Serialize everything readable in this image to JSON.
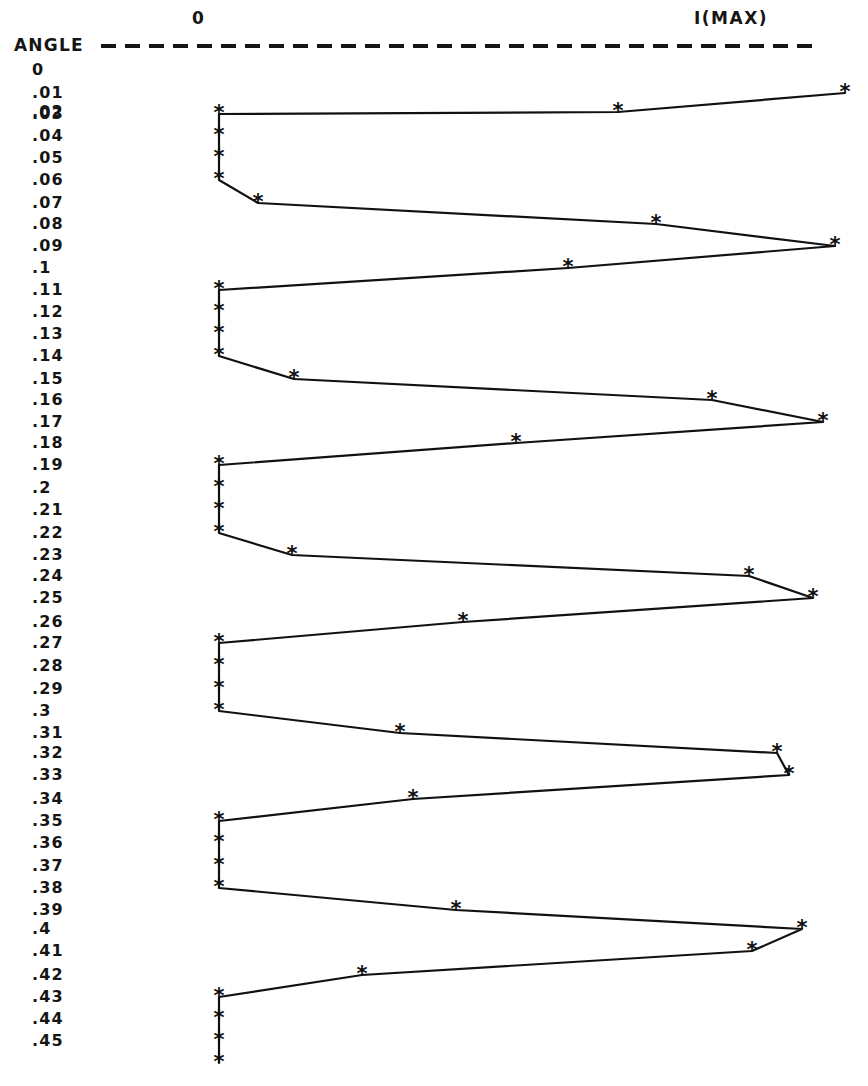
{
  "header": {
    "left_column_label": "0",
    "right_column_label": "I(MAX)",
    "axis_caption": "ANGLE"
  },
  "chart_data": {
    "type": "line",
    "title": "",
    "subtitle": "",
    "xlabel": "I(MAX)",
    "ylabel": "ANGLE",
    "orientation": "horizontal-value-vertical-category",
    "grid": false,
    "legend": false,
    "axis_origin_label": "0",
    "axis_max_label": "I(MAX)",
    "x_axis_pixel_origin": 219,
    "x_axis_pixel_max": 850,
    "marker_glyph": "*",
    "line_color": "#111111",
    "marker_color": "#111111",
    "categories": [
      "0",
      ".01",
      ".02",
      ".03",
      ".04",
      ".05",
      ".06",
      ".07",
      ".08",
      ".09",
      ".1",
      ".11",
      ".12",
      ".13",
      ".14",
      ".15",
      ".16",
      ".17",
      ".18",
      ".19",
      ".2",
      ".21",
      ".22",
      ".23",
      ".24",
      ".25",
      ".26",
      ".27",
      ".28",
      ".29",
      ".3",
      ".31",
      ".32",
      ".33",
      ".34",
      ".35",
      ".36",
      ".37",
      ".38",
      ".39",
      ".4",
      ".41",
      ".42",
      ".43",
      ".44",
      ".45"
    ],
    "values": [
      null,
      0.992,
      0.633,
      0.0,
      0.0,
      0.0,
      0.062,
      0.694,
      0.975,
      0.553,
      0.0,
      0.0,
      0.0,
      0.0,
      0.118,
      0.781,
      0.957,
      0.469,
      0.0,
      0.0,
      0.0,
      0.0,
      0.117,
      0.84,
      0.941,
      0.387,
      0.0,
      0.0,
      0.0,
      0.0,
      0.179,
      0.884,
      0.903,
      0.307,
      0.0,
      0.0,
      0.0,
      0.0,
      0.239,
      0.924,
      0.845,
      0.227,
      0.0,
      0.0,
      0.0,
      0.0
    ],
    "points_pixels": [
      {
        "category": "0",
        "x": null,
        "y": 70
      },
      {
        "category": ".01",
        "x": 845,
        "y": 93
      },
      {
        "category": ".02",
        "x": 618,
        "y": 112
      },
      {
        "category": ".03",
        "x": 219,
        "y": 114
      },
      {
        "category": ".04",
        "x": 219,
        "y": 136
      },
      {
        "category": ".05",
        "x": 219,
        "y": 158
      },
      {
        "category": ".06",
        "x": 219,
        "y": 180
      },
      {
        "category": ".07",
        "x": 258,
        "y": 203
      },
      {
        "category": ".08",
        "x": 656,
        "y": 224
      },
      {
        "category": ".09",
        "x": 835,
        "y": 246
      },
      {
        "category": ".1",
        "x": 568,
        "y": 268
      },
      {
        "category": ".11",
        "x": 219,
        "y": 290
      },
      {
        "category": ".12",
        "x": 219,
        "y": 312
      },
      {
        "category": ".13",
        "x": 219,
        "y": 334
      },
      {
        "category": ".14",
        "x": 219,
        "y": 356
      },
      {
        "category": ".15",
        "x": 294,
        "y": 379
      },
      {
        "category": ".16",
        "x": 712,
        "y": 400
      },
      {
        "category": ".17",
        "x": 823,
        "y": 422
      },
      {
        "category": ".18",
        "x": 516,
        "y": 443
      },
      {
        "category": ".19",
        "x": 219,
        "y": 465
      },
      {
        "category": ".2",
        "x": 219,
        "y": 488
      },
      {
        "category": ".21",
        "x": 219,
        "y": 510
      },
      {
        "category": ".22",
        "x": 219,
        "y": 533
      },
      {
        "category": ".23",
        "x": 292,
        "y": 555
      },
      {
        "category": ".24",
        "x": 749,
        "y": 576
      },
      {
        "category": ".25",
        "x": 813,
        "y": 598
      },
      {
        "category": ".26",
        "x": 463,
        "y": 622
      },
      {
        "category": ".27",
        "x": 219,
        "y": 643
      },
      {
        "category": ".28",
        "x": 219,
        "y": 666
      },
      {
        "category": ".29",
        "x": 219,
        "y": 689
      },
      {
        "category": ".3",
        "x": 219,
        "y": 711
      },
      {
        "category": ".31",
        "x": 400,
        "y": 733
      },
      {
        "category": ".32",
        "x": 777,
        "y": 753
      },
      {
        "category": ".33",
        "x": 789,
        "y": 775
      },
      {
        "category": ".34",
        "x": 413,
        "y": 799
      },
      {
        "category": ".35",
        "x": 219,
        "y": 821
      },
      {
        "category": ".36",
        "x": 219,
        "y": 843
      },
      {
        "category": ".37",
        "x": 219,
        "y": 866
      },
      {
        "category": ".38",
        "x": 219,
        "y": 888
      },
      {
        "category": ".39",
        "x": 456,
        "y": 910
      },
      {
        "category": ".4",
        "x": 802,
        "y": 929
      },
      {
        "category": ".41",
        "x": 752,
        "y": 951
      },
      {
        "category": ".42",
        "x": 362,
        "y": 975
      },
      {
        "category": ".43",
        "x": 219,
        "y": 997
      },
      {
        "category": ".44",
        "x": 219,
        "y": 1019
      },
      {
        "category": ".45",
        "x": 219,
        "y": 1041
      },
      {
        "category": ".45b",
        "x": 219,
        "y": 1063
      }
    ]
  },
  "colors": {
    "ink": "#111111",
    "paper": "#ffffff"
  }
}
